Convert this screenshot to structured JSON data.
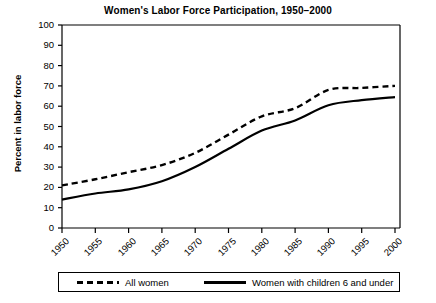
{
  "chart_data": {
    "type": "line",
    "title": "Women's Labor Force Participation, 1950–2000",
    "xlabel": "",
    "ylabel": "Percent in labor force",
    "x": [
      1950,
      1955,
      1960,
      1965,
      1970,
      1975,
      1980,
      1985,
      1990,
      1995,
      2000
    ],
    "xtick_labels": [
      "1950",
      "1955",
      "1960",
      "1965",
      "1970",
      "1975",
      "1980",
      "1985",
      "1990",
      "1995",
      "2000"
    ],
    "ytick_labels": [
      "0",
      "10",
      "20",
      "30",
      "40",
      "50",
      "60",
      "70",
      "80",
      "90",
      "100"
    ],
    "yticks": [
      0,
      10,
      20,
      30,
      40,
      50,
      60,
      70,
      80,
      90,
      100
    ],
    "ylim": [
      0,
      100
    ],
    "xlim": [
      1950,
      2000
    ],
    "grid": false,
    "legend_position": "below-axes",
    "series": [
      {
        "name": "All women",
        "style": "dashed",
        "color": "#000000",
        "values": [
          21,
          24,
          27.5,
          31,
          37,
          46,
          55,
          59,
          68,
          69,
          70
        ]
      },
      {
        "name": "Women with children 6 and under",
        "style": "solid",
        "color": "#000000",
        "values": [
          14,
          17,
          19,
          23,
          30,
          39,
          48,
          53,
          60.5,
          63,
          64.5
        ]
      }
    ]
  },
  "legend": {
    "entries": [
      {
        "label": "All women",
        "style": "dashed"
      },
      {
        "label": "Women with children 6 and under",
        "style": "solid"
      }
    ]
  }
}
